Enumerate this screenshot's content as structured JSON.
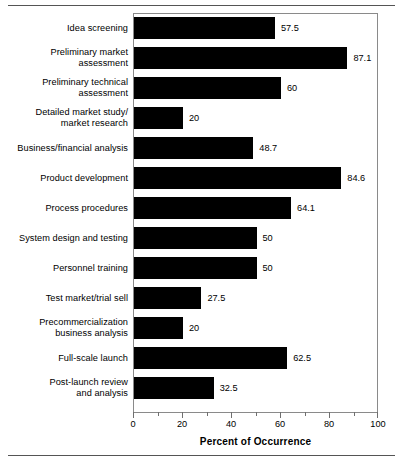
{
  "figure": {
    "has_top_rule": true,
    "has_bottom_rule": true,
    "frame_color": "#8a8a8a",
    "bar_color": "#000000"
  },
  "chart_data": {
    "type": "bar",
    "orientation": "horizontal",
    "title": "",
    "xlabel": "Percent of Occurrence",
    "ylabel": "",
    "xlim": [
      0,
      100
    ],
    "grid": false,
    "legend": null,
    "xticks": [
      0,
      20,
      40,
      60,
      80,
      100
    ],
    "xtick_labels": [
      "0",
      "20",
      "40",
      "60",
      "80",
      "100"
    ],
    "minor_xticks": [
      10,
      30,
      50,
      70,
      90
    ],
    "categories": [
      "Idea screening",
      "Preliminary market assessment",
      "Preliminary technical assessment",
      "Detailed market study/ market research",
      "Business/financial analysis",
      "Product development",
      "Process procedures",
      "System design and testing",
      "Personnel training",
      "Test market/trial sell",
      "Precommercialization business analysis",
      "Full-scale launch",
      "Post-launch review and analysis"
    ],
    "category_lines": [
      [
        "Idea screening"
      ],
      [
        "Preliminary market",
        "assessment"
      ],
      [
        "Preliminary technical",
        "assessment"
      ],
      [
        "Detailed market study/",
        "market research"
      ],
      [
        "Business/financial analysis"
      ],
      [
        "Product development"
      ],
      [
        "Process procedures"
      ],
      [
        "System design and testing"
      ],
      [
        "Personnel training"
      ],
      [
        "Test market/trial sell"
      ],
      [
        "Precommercialization",
        "business analysis"
      ],
      [
        "Full-scale launch"
      ],
      [
        "Post-launch review",
        "and analysis"
      ]
    ],
    "values": [
      57.5,
      87.1,
      60,
      20,
      48.7,
      84.6,
      64.1,
      50,
      50,
      27.5,
      20,
      62.5,
      32.5
    ],
    "value_labels": [
      "57.5",
      "87.1",
      "60",
      "20",
      "48.7",
      "84.6",
      "64.1",
      "50",
      "50",
      "27.5",
      "20",
      "62.5",
      "32.5"
    ]
  }
}
